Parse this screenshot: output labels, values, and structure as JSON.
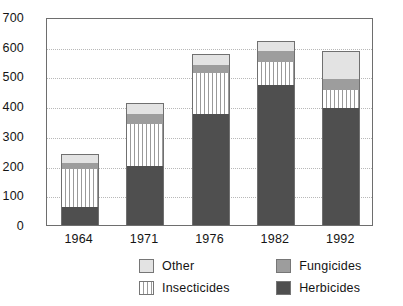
{
  "chart_data": {
    "type": "bar",
    "subtype": "stacked-bar",
    "title": "",
    "xlabel": "",
    "ylabel": "",
    "ylim": [
      0,
      700
    ],
    "ytick_step": 100,
    "yticks": [
      0,
      100,
      200,
      300,
      400,
      500,
      600,
      700
    ],
    "ytick_labels": [
      "0",
      "100",
      "200",
      "300",
      "400",
      "500",
      "600",
      "700"
    ],
    "grid": true,
    "grid_axis": "y",
    "legend_position": "bottom",
    "categories": [
      "1964",
      "1971",
      "1976",
      "1982",
      "1992"
    ],
    "stack_order_bottom_to_top": [
      "Herbicides",
      "Insecticides",
      "Fungicides",
      "Other"
    ],
    "series": [
      {
        "name": "Herbicides",
        "color": "#4f4f4f",
        "values": [
          60,
          200,
          375,
          470,
          395
        ]
      },
      {
        "name": "Insecticides",
        "color": "#ffffff",
        "values": [
          130,
          140,
          135,
          80,
          60
        ]
      },
      {
        "name": "Fungicides",
        "color": "#9d9d9d",
        "values": [
          20,
          35,
          30,
          35,
          35
        ]
      },
      {
        "name": "Other",
        "color": "#e3e3e3",
        "values": [
          30,
          35,
          35,
          35,
          95
        ]
      }
    ],
    "totals": [
      240,
      410,
      575,
      620,
      585
    ]
  },
  "legend": {
    "items": [
      {
        "label": "Other",
        "swatch": "light-gray-swatch"
      },
      {
        "label": "Fungicides",
        "swatch": "medium-gray-swatch"
      },
      {
        "label": "Insecticides",
        "swatch": "striped-swatch"
      },
      {
        "label": "Herbicides",
        "swatch": "dark-gray-swatch"
      }
    ]
  }
}
